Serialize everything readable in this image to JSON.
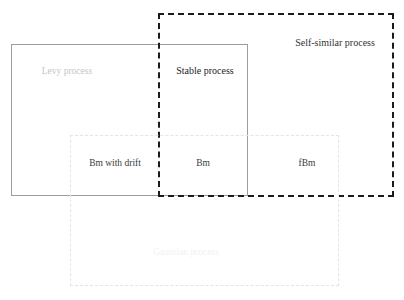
{
  "diagram": {
    "background_color": "#ffffff",
    "regions": [
      {
        "id": "levy",
        "label": "Levy process",
        "border_style": "solid",
        "border_color": "#9d9d9d",
        "border_width": 1,
        "text_color": "#c6c6c6",
        "x": 11,
        "y": 44,
        "width": 237,
        "height": 152,
        "label_x": 67,
        "label_y": 72
      },
      {
        "id": "self-similar",
        "label": "Self-similar process",
        "border_style": "dashed",
        "border_color": "#1b1b1b",
        "border_width": 2,
        "text_color": "#333333",
        "x": 158,
        "y": 13,
        "width": 236,
        "height": 184,
        "label_x": 335,
        "label_y": 43
      },
      {
        "id": "gaussian",
        "label": "Gaussian process",
        "border_style": "dashed",
        "border_color": "#e4e4e4",
        "border_width": 1,
        "text_color": "#f2f2f2",
        "x": 70,
        "y": 135,
        "width": 269,
        "height": 151,
        "label_x": 186,
        "label_y": 253
      }
    ],
    "intersection_labels": [
      {
        "id": "stable-process",
        "label": "Stable process",
        "x": 205,
        "y": 71,
        "text_color": "#232323"
      },
      {
        "id": "bm-with-drift",
        "label": "Bm with drift",
        "x": 115,
        "y": 164,
        "text_color": "#3a3a3a"
      },
      {
        "id": "bm",
        "label": "Bm",
        "x": 203,
        "y": 164,
        "text_color": "#3a3a3a"
      },
      {
        "id": "fbm",
        "label": "fBm",
        "x": 307,
        "y": 164,
        "text_color": "#3a3a3a"
      }
    ]
  }
}
